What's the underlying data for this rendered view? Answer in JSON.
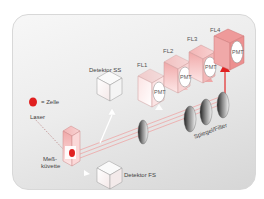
{
  "diagram": {
    "type": "flow-cytometry-optical-setup",
    "legend": {
      "symbol": "red-dot",
      "label": "= Zelle"
    },
    "labels": {
      "laser": "Laser",
      "cuvette_line1": "Meß-",
      "cuvette_line2": "küvette",
      "detector_ss": "Detektor SS",
      "detector_fs": "Detektor FS",
      "mirror_filter": "Spiegel/Filter"
    },
    "fluorescence_channels": [
      {
        "name": "FL1",
        "detector": "PMT"
      },
      {
        "name": "FL2",
        "detector": "PMT"
      },
      {
        "name": "FL3",
        "detector": "PMT"
      },
      {
        "name": "FL4",
        "detector": "PMT"
      }
    ],
    "colors": {
      "accent_red": "#e02020",
      "beam_pink": "#f0a0a0",
      "box_pink": "#f4c4c4",
      "panel_gray": "#e6e6e6"
    }
  }
}
